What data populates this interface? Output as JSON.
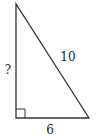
{
  "diagram": {
    "type": "right-triangle",
    "colors": {
      "stroke": "#333333",
      "text": "#222222",
      "background": "#ffffff"
    },
    "vertices": {
      "top": [
        16,
        4
      ],
      "right_angle": [
        16,
        118
      ],
      "bottom_right": [
        89,
        118
      ]
    },
    "labels": {
      "vertical_leg": "?",
      "hypotenuse": "10",
      "horizontal_leg": "6"
    },
    "right_angle_marker": true
  }
}
